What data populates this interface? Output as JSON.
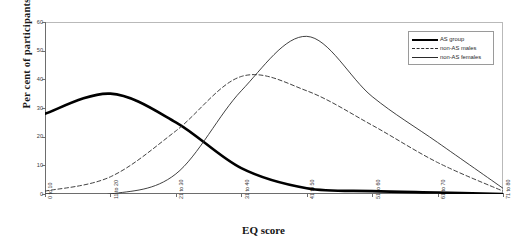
{
  "chart_data": {
    "type": "line",
    "title": "",
    "xlabel": "EQ score",
    "ylabel": "Per cent of participants",
    "ylim": [
      0,
      60
    ],
    "yticks": [
      0,
      10,
      20,
      30,
      40,
      50,
      60
    ],
    "grid": false,
    "legend_position": "top-right",
    "categories": [
      "0 to 10",
      "11 to 20",
      "21 to 30",
      "31 to 40",
      "41 to 50",
      "51 to 60",
      "61 to 70",
      "71 to 80"
    ],
    "series": [
      {
        "name": "AS group",
        "style": "thick-solid",
        "color": "#000000",
        "values": [
          28,
          35,
          25,
          9,
          2,
          1,
          0.5,
          0
        ]
      },
      {
        "name": "non-AS males",
        "style": "dashed",
        "color": "#2b2b2b",
        "values": [
          1,
          6,
          22,
          41,
          36,
          24,
          11,
          1
        ]
      },
      {
        "name": "non-AS females",
        "style": "thin-solid",
        "color": "#2b2b2b",
        "values": [
          0,
          0,
          7,
          36,
          55,
          34,
          18,
          2
        ]
      }
    ]
  },
  "legend": {
    "items": [
      {
        "label": "AS group"
      },
      {
        "label": "non-AS males"
      },
      {
        "label": "non-AS females"
      }
    ]
  }
}
